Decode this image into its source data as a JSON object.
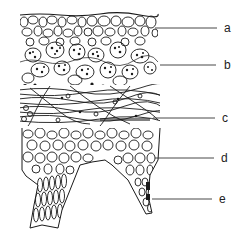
{
  "figure": {
    "type": "cross-section illustration",
    "labels": [
      {
        "id": "a",
        "text": "a",
        "y": 28
      },
      {
        "id": "b",
        "text": "b",
        "y": 65
      },
      {
        "id": "c",
        "text": "c",
        "y": 118
      },
      {
        "id": "d",
        "text": "d",
        "y": 158
      },
      {
        "id": "e",
        "text": "e",
        "y": 199
      }
    ],
    "colors": {
      "ink": "#1a1a1a",
      "background": "#ffffff"
    }
  }
}
